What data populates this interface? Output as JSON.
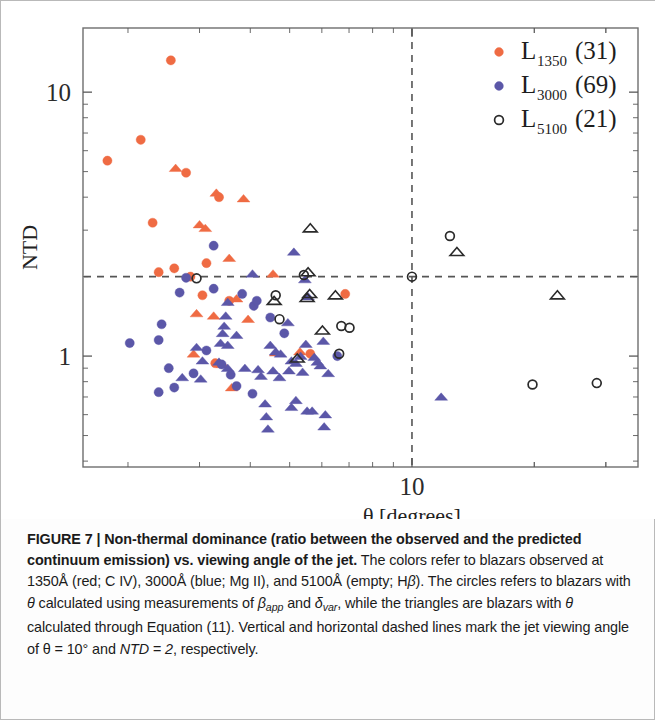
{
  "figure": {
    "label": "FIGURE 7",
    "separator": "|",
    "title_bold": "Non-thermal dominance (ratio between the observed and the predicted continuum emission) vs. viewing angle of the jet.",
    "caption_rest_1": "The colors refer to blazars observed at 1350Å (red; C IV), 3000Å (blue; Mg II), and 5100Å (empty; H",
    "caption_beta_1": "β",
    "caption_rest_2": "). The circles refers to blazars with ",
    "caption_theta_1": "θ",
    "caption_rest_3": " calculated using measurements of ",
    "caption_beta_app": "β",
    "caption_beta_app_sub": "app",
    "caption_rest_4": " and ",
    "caption_delta_var": "δ",
    "caption_delta_var_sub": "var",
    "caption_rest_5": ", while the triangles are blazars with ",
    "caption_theta_2": "θ",
    "caption_rest_6": " calculated through Equation (11). Vertical and horizontal dashed lines mark the jet viewing angle of ",
    "caption_theta_eq": "θ = 10°",
    "caption_rest_7": " and ",
    "caption_ntd_eq": "NTD = 2",
    "caption_rest_8": ", respectively."
  },
  "chart_data": {
    "type": "scatter",
    "title": "",
    "xlabel": "θ [degrees]",
    "ylabel": "NTD",
    "xscale": "log",
    "yscale": "log",
    "xlim": [
      1.55,
      36.0
    ],
    "ylim": [
      0.38,
      17.5
    ],
    "xticks_major": [
      10
    ],
    "xticklabels": [
      "10"
    ],
    "yticks_major": [
      1,
      10
    ],
    "yticklabels": [
      "1",
      "10"
    ],
    "grid": false,
    "legend_position": "top-right",
    "reference_lines": [
      {
        "name": "theta-10-deg",
        "orientation": "vertical",
        "value": 10,
        "style": "dashed",
        "color": "#555555"
      },
      {
        "name": "ntd-2",
        "orientation": "horizontal",
        "value": 2,
        "style": "dashed",
        "color": "#555555"
      }
    ],
    "legend": [
      {
        "name": "L1350",
        "base": "L",
        "sub": "1350",
        "count": "(31)",
        "color": "#ef6b43",
        "marker": "filled-circle"
      },
      {
        "name": "L3000",
        "base": "L",
        "sub": "3000",
        "count": "(69)",
        "color": "#5b57a8",
        "marker": "filled-circle"
      },
      {
        "name": "L5100",
        "base": "L",
        "sub": "5100",
        "count": "(21)",
        "color": "#2a2a2a",
        "marker": "open-circle"
      }
    ],
    "series": [
      {
        "name": "L1350",
        "color": "#ef6b43",
        "marker_circle": "circle",
        "marker_triangle": "triangle",
        "points": [
          {
            "x": 2.55,
            "y": 13.2,
            "m": "circle"
          },
          {
            "x": 2.15,
            "y": 6.6,
            "m": "circle"
          },
          {
            "x": 1.78,
            "y": 5.5,
            "m": "circle"
          },
          {
            "x": 2.62,
            "y": 5.15,
            "m": "triangle"
          },
          {
            "x": 2.78,
            "y": 4.95,
            "m": "circle"
          },
          {
            "x": 3.3,
            "y": 4.15,
            "m": "triangle"
          },
          {
            "x": 3.35,
            "y": 4.0,
            "m": "circle"
          },
          {
            "x": 3.85,
            "y": 3.95,
            "m": "triangle"
          },
          {
            "x": 2.3,
            "y": 3.2,
            "m": "circle"
          },
          {
            "x": 3.0,
            "y": 3.15,
            "m": "triangle"
          },
          {
            "x": 3.1,
            "y": 3.05,
            "m": "triangle"
          },
          {
            "x": 3.55,
            "y": 2.35,
            "m": "triangle"
          },
          {
            "x": 2.38,
            "y": 2.08,
            "m": "circle"
          },
          {
            "x": 2.6,
            "y": 2.15,
            "m": "circle"
          },
          {
            "x": 3.12,
            "y": 2.25,
            "m": "circle"
          },
          {
            "x": 2.85,
            "y": 2.0,
            "m": "circle"
          },
          {
            "x": 4.55,
            "y": 2.05,
            "m": "triangle"
          },
          {
            "x": 6.85,
            "y": 1.72,
            "m": "circle"
          },
          {
            "x": 3.05,
            "y": 1.7,
            "m": "circle"
          },
          {
            "x": 3.55,
            "y": 1.62,
            "m": "circle"
          },
          {
            "x": 3.7,
            "y": 1.65,
            "m": "triangle"
          },
          {
            "x": 2.95,
            "y": 1.45,
            "m": "triangle"
          },
          {
            "x": 3.25,
            "y": 1.42,
            "m": "triangle"
          },
          {
            "x": 3.95,
            "y": 1.38,
            "m": "triangle"
          },
          {
            "x": 2.9,
            "y": 1.02,
            "m": "triangle"
          },
          {
            "x": 4.62,
            "y": 1.03,
            "m": "triangle"
          },
          {
            "x": 5.3,
            "y": 1.04,
            "m": "triangle"
          },
          {
            "x": 5.62,
            "y": 1.02,
            "m": "circle"
          },
          {
            "x": 3.28,
            "y": 0.94,
            "m": "circle"
          },
          {
            "x": 3.42,
            "y": 0.93,
            "m": "triangle"
          },
          {
            "x": 3.6,
            "y": 0.76,
            "m": "triangle"
          }
        ]
      },
      {
        "name": "L3000",
        "color": "#5b57a8",
        "marker_circle": "circle",
        "marker_triangle": "triangle",
        "points": [
          {
            "x": 3.25,
            "y": 2.62,
            "m": "circle"
          },
          {
            "x": 5.12,
            "y": 2.48,
            "m": "triangle"
          },
          {
            "x": 4.05,
            "y": 2.05,
            "m": "triangle"
          },
          {
            "x": 2.78,
            "y": 1.98,
            "m": "circle"
          },
          {
            "x": 5.45,
            "y": 1.95,
            "m": "triangle"
          },
          {
            "x": 3.25,
            "y": 1.8,
            "m": "circle"
          },
          {
            "x": 2.68,
            "y": 1.74,
            "m": "circle"
          },
          {
            "x": 3.82,
            "y": 1.72,
            "m": "circle"
          },
          {
            "x": 5.55,
            "y": 1.68,
            "m": "triangle"
          },
          {
            "x": 3.52,
            "y": 1.6,
            "m": "triangle"
          },
          {
            "x": 4.08,
            "y": 1.55,
            "m": "circle"
          },
          {
            "x": 2.42,
            "y": 1.32,
            "m": "circle"
          },
          {
            "x": 3.48,
            "y": 1.42,
            "m": "triangle"
          },
          {
            "x": 4.48,
            "y": 1.4,
            "m": "circle"
          },
          {
            "x": 3.45,
            "y": 1.3,
            "m": "triangle"
          },
          {
            "x": 3.42,
            "y": 1.22,
            "m": "triangle"
          },
          {
            "x": 3.7,
            "y": 1.2,
            "m": "triangle"
          },
          {
            "x": 4.85,
            "y": 1.22,
            "m": "circle"
          },
          {
            "x": 2.02,
            "y": 1.12,
            "m": "circle"
          },
          {
            "x": 2.38,
            "y": 1.15,
            "m": "circle"
          },
          {
            "x": 3.38,
            "y": 1.12,
            "m": "triangle"
          },
          {
            "x": 3.52,
            "y": 1.1,
            "m": "triangle"
          },
          {
            "x": 4.48,
            "y": 1.1,
            "m": "triangle"
          },
          {
            "x": 5.48,
            "y": 1.11,
            "m": "triangle"
          },
          {
            "x": 6.05,
            "y": 1.14,
            "m": "triangle"
          },
          {
            "x": 2.95,
            "y": 1.08,
            "m": "triangle"
          },
          {
            "x": 3.12,
            "y": 1.05,
            "m": "circle"
          },
          {
            "x": 4.62,
            "y": 1.04,
            "m": "triangle"
          },
          {
            "x": 4.75,
            "y": 1.02,
            "m": "triangle"
          },
          {
            "x": 5.32,
            "y": 1.0,
            "m": "triangle"
          },
          {
            "x": 5.75,
            "y": 0.99,
            "m": "triangle"
          },
          {
            "x": 6.55,
            "y": 1.0,
            "m": "circle"
          },
          {
            "x": 3.05,
            "y": 0.96,
            "m": "triangle"
          },
          {
            "x": 3.35,
            "y": 0.95,
            "m": "triangle"
          },
          {
            "x": 3.4,
            "y": 0.93,
            "m": "circle"
          },
          {
            "x": 5.05,
            "y": 0.96,
            "m": "triangle"
          },
          {
            "x": 5.18,
            "y": 0.94,
            "m": "triangle"
          },
          {
            "x": 5.85,
            "y": 0.95,
            "m": "triangle"
          },
          {
            "x": 5.95,
            "y": 0.92,
            "m": "triangle"
          },
          {
            "x": 2.52,
            "y": 0.9,
            "m": "circle"
          },
          {
            "x": 3.52,
            "y": 0.9,
            "m": "triangle"
          },
          {
            "x": 3.88,
            "y": 0.9,
            "m": "triangle"
          },
          {
            "x": 4.18,
            "y": 0.89,
            "m": "triangle"
          },
          {
            "x": 4.55,
            "y": 0.88,
            "m": "triangle"
          },
          {
            "x": 4.98,
            "y": 0.88,
            "m": "triangle"
          },
          {
            "x": 5.38,
            "y": 0.87,
            "m": "triangle"
          },
          {
            "x": 2.9,
            "y": 0.86,
            "m": "circle"
          },
          {
            "x": 3.58,
            "y": 0.85,
            "m": "circle"
          },
          {
            "x": 4.25,
            "y": 0.84,
            "m": "triangle"
          },
          {
            "x": 4.72,
            "y": 0.83,
            "m": "triangle"
          },
          {
            "x": 2.72,
            "y": 0.83,
            "m": "triangle"
          },
          {
            "x": 3.02,
            "y": 0.82,
            "m": "triangle"
          },
          {
            "x": 6.22,
            "y": 0.86,
            "m": "triangle"
          },
          {
            "x": 2.6,
            "y": 0.76,
            "m": "circle"
          },
          {
            "x": 3.7,
            "y": 0.77,
            "m": "circle"
          },
          {
            "x": 2.38,
            "y": 0.73,
            "m": "circle"
          },
          {
            "x": 4.05,
            "y": 0.72,
            "m": "circle"
          },
          {
            "x": 4.35,
            "y": 0.66,
            "m": "triangle"
          },
          {
            "x": 5.18,
            "y": 0.68,
            "m": "triangle"
          },
          {
            "x": 5.05,
            "y": 0.64,
            "m": "triangle"
          },
          {
            "x": 5.52,
            "y": 0.62,
            "m": "triangle"
          },
          {
            "x": 5.68,
            "y": 0.62,
            "m": "triangle"
          },
          {
            "x": 6.12,
            "y": 0.6,
            "m": "triangle"
          },
          {
            "x": 4.38,
            "y": 0.59,
            "m": "triangle"
          },
          {
            "x": 4.42,
            "y": 0.53,
            "m": "triangle"
          },
          {
            "x": 6.08,
            "y": 0.54,
            "m": "triangle"
          },
          {
            "x": 11.8,
            "y": 0.7,
            "m": "triangle"
          },
          {
            "x": 4.15,
            "y": 1.62,
            "m": "circle"
          },
          {
            "x": 4.95,
            "y": 1.34,
            "m": "triangle"
          }
        ]
      },
      {
        "name": "L5100",
        "color": "#2a2a2a",
        "marker_circle": "open-circle",
        "marker_triangle": "open-triangle",
        "points": [
          {
            "x": 5.62,
            "y": 3.05,
            "m": "open-triangle"
          },
          {
            "x": 12.4,
            "y": 2.85,
            "m": "open-circle"
          },
          {
            "x": 12.9,
            "y": 2.48,
            "m": "open-triangle"
          },
          {
            "x": 5.55,
            "y": 2.08,
            "m": "open-triangle"
          },
          {
            "x": 5.42,
            "y": 2.03,
            "m": "open-circle"
          },
          {
            "x": 10.0,
            "y": 2.0,
            "m": "open-circle"
          },
          {
            "x": 2.95,
            "y": 1.97,
            "m": "open-circle"
          },
          {
            "x": 5.6,
            "y": 1.72,
            "m": "open-triangle"
          },
          {
            "x": 5.52,
            "y": 1.66,
            "m": "open-triangle"
          },
          {
            "x": 4.62,
            "y": 1.7,
            "m": "open-circle"
          },
          {
            "x": 4.58,
            "y": 1.62,
            "m": "open-triangle"
          },
          {
            "x": 6.48,
            "y": 1.7,
            "m": "open-triangle"
          },
          {
            "x": 22.8,
            "y": 1.7,
            "m": "open-triangle"
          },
          {
            "x": 4.72,
            "y": 1.38,
            "m": "open-circle"
          },
          {
            "x": 6.02,
            "y": 1.25,
            "m": "open-triangle"
          },
          {
            "x": 6.7,
            "y": 1.3,
            "m": "open-circle"
          },
          {
            "x": 7.02,
            "y": 1.28,
            "m": "open-circle"
          },
          {
            "x": 6.62,
            "y": 1.02,
            "m": "open-circle"
          },
          {
            "x": 5.22,
            "y": 0.98,
            "m": "open-triangle"
          },
          {
            "x": 19.8,
            "y": 0.78,
            "m": "open-circle"
          },
          {
            "x": 28.5,
            "y": 0.79,
            "m": "open-circle"
          }
        ]
      }
    ]
  }
}
